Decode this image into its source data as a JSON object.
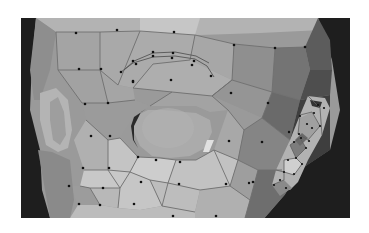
{
  "figure": {
    "alt": "3D polygon mesh of a stylized head showing edge loops around the eye, brow and ear",
    "background": "#ffffff",
    "viewport_bg": "#1c1c1c",
    "colors": {
      "face_light": "#c9c9c9",
      "face_mid": "#a8a8a8",
      "face_dark": "#6e6e6e",
      "face_shadow": "#3e3e3e",
      "edge": "#7a7a7a",
      "vertex": "#111111",
      "eyeball": "#a9a9a9",
      "ear": "#b5b5b5"
    },
    "regions": [
      "forehead",
      "brow-loop",
      "eye-socket",
      "eyeball",
      "cheek",
      "left-ear",
      "right-ear",
      "temple"
    ]
  }
}
